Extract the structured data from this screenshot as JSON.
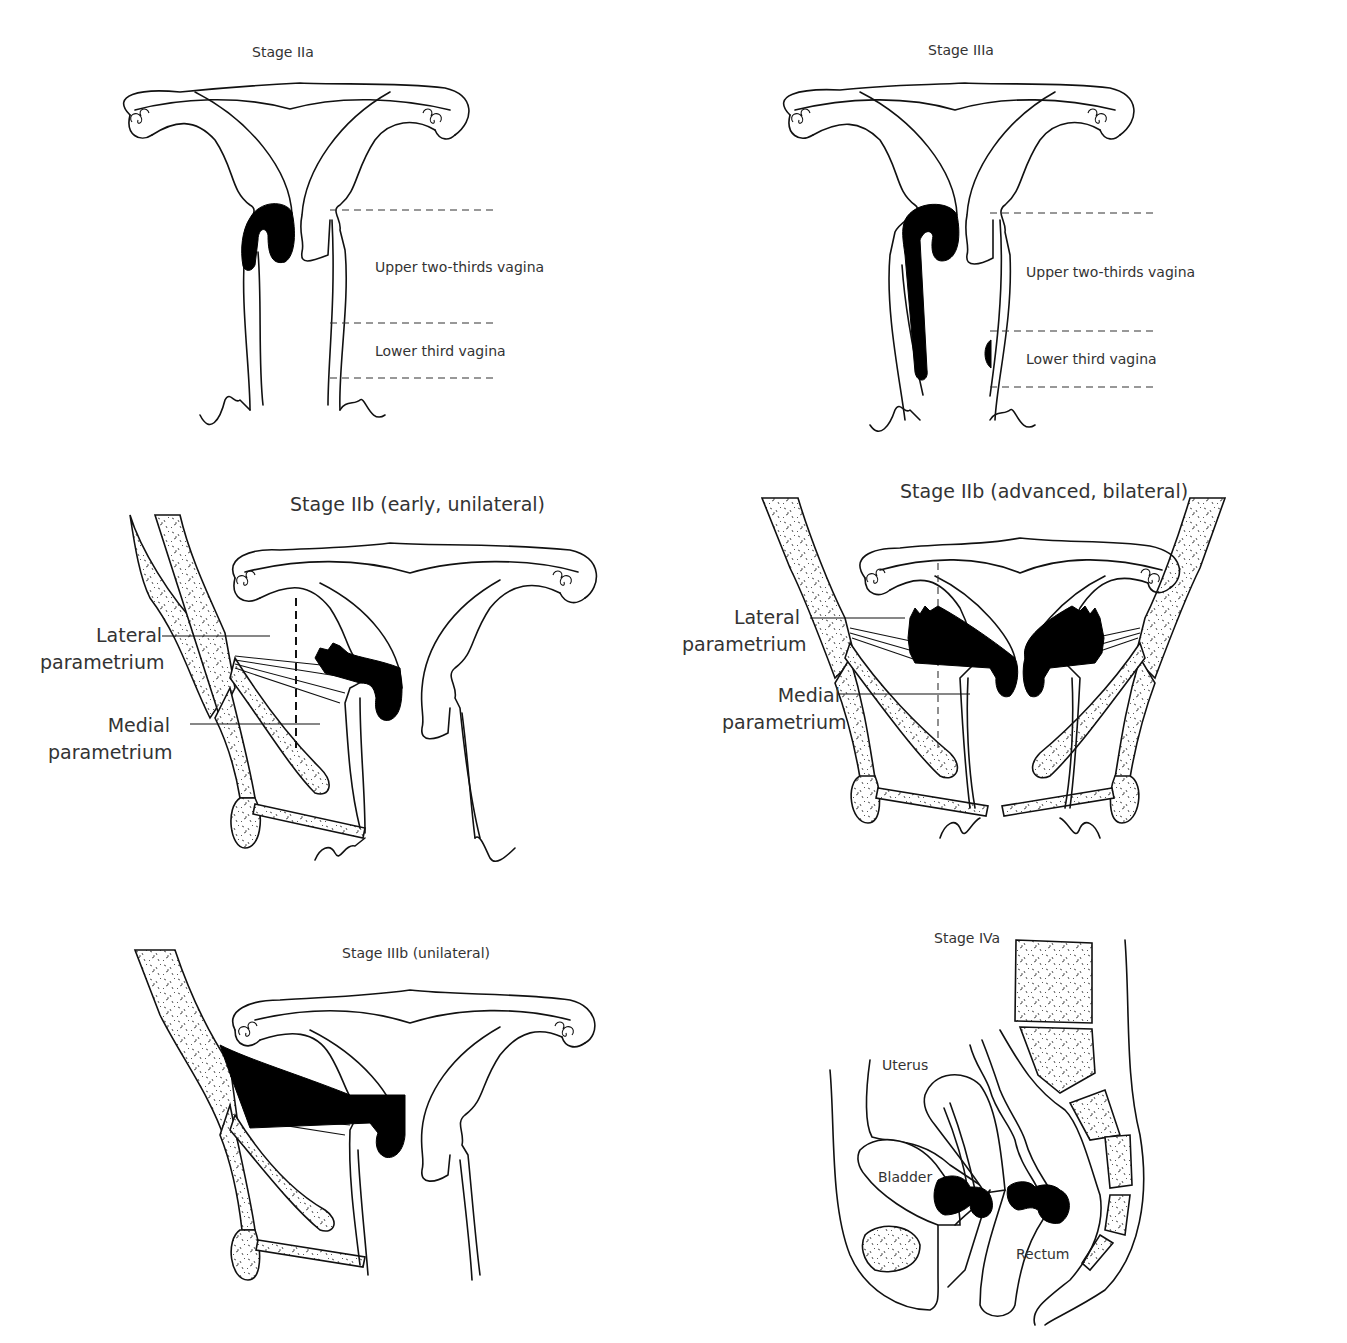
{
  "figure": {
    "panels": [
      {
        "id": "stage-iia",
        "title": "Stage IIa",
        "labels": [
          "Upper two-thirds vagina",
          "Lower third vagina"
        ]
      },
      {
        "id": "stage-iiia",
        "title": "Stage IIIa",
        "labels": [
          "Upper two-thirds vagina",
          "Lower third vagina"
        ]
      },
      {
        "id": "stage-iib-early",
        "title": "Stage IIb (early, unilateral)",
        "labels": {
          "lateral_1": "Lateral",
          "lateral_2": "parametrium",
          "medial_1": "Medial",
          "medial_2": "parametrium"
        }
      },
      {
        "id": "stage-iib-advanced",
        "title": "Stage IIb (advanced, bilateral)",
        "labels": {
          "lateral_1": "Lateral",
          "lateral_2": "parametrium",
          "medial_1": "Medial",
          "medial_2": "parametrium"
        }
      },
      {
        "id": "stage-iiib",
        "title": "Stage IIIb (unilateral)",
        "labels": []
      },
      {
        "id": "stage-iva",
        "title": "Stage IVa",
        "labels": {
          "uterus": "Uterus",
          "bladder": "Bladder",
          "rectum": "Rectum"
        }
      }
    ]
  },
  "colors": {
    "background": "#ffffff",
    "line": "#111111",
    "tumor": "#000000",
    "text": "#333333"
  }
}
